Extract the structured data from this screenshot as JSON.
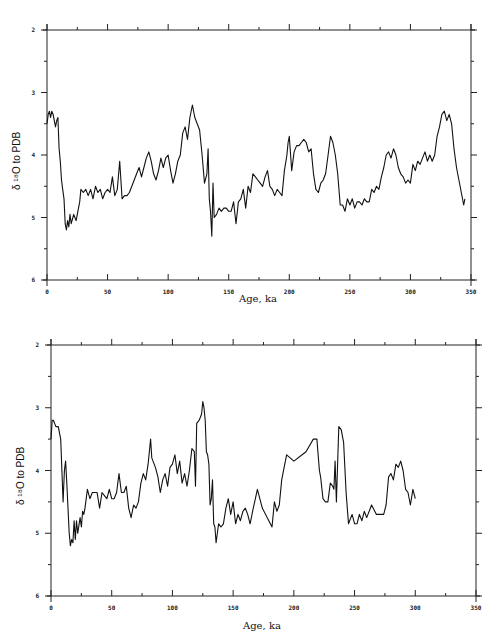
{
  "chart_data": [
    {
      "type": "line",
      "title": "",
      "xlabel": "Age, ka",
      "ylabel": "δ 18O to PDB",
      "xlim": [
        0,
        350
      ],
      "ylim": [
        6,
        2
      ],
      "y_inverted": true,
      "x_ticks": [
        "0",
        "50",
        "100",
        "150",
        "200",
        "250",
        "300",
        "350"
      ],
      "y_ticks": [
        "2",
        "3",
        "4",
        "5",
        "6"
      ],
      "grid": false,
      "legend": null,
      "series": [
        {
          "name": "record-1",
          "x": [
            0,
            1,
            2,
            3,
            4,
            5,
            6,
            7,
            8,
            9,
            10,
            11,
            12,
            13,
            14,
            15,
            16,
            17,
            18,
            19,
            20,
            22,
            24,
            26,
            27,
            28,
            30,
            32,
            34,
            36,
            38,
            40,
            42,
            44,
            46,
            48,
            50,
            52,
            54,
            56,
            58,
            60,
            62,
            64,
            66,
            68,
            70,
            72,
            74,
            76,
            78,
            80,
            82,
            84,
            86,
            88,
            90,
            92,
            94,
            96,
            98,
            100,
            102,
            104,
            106,
            108,
            110,
            112,
            114,
            116,
            118,
            120,
            122,
            124,
            126,
            128,
            130,
            132,
            133,
            134,
            135,
            136,
            137,
            138,
            140,
            142,
            144,
            146,
            148,
            150,
            152,
            154,
            156,
            158,
            160,
            162,
            164,
            166,
            168,
            170,
            172,
            174,
            176,
            178,
            180,
            182,
            184,
            186,
            188,
            190,
            192,
            194,
            196,
            198,
            199,
            200,
            202,
            204,
            206,
            208,
            210,
            212,
            214,
            216,
            218,
            220,
            222,
            224,
            226,
            228,
            230,
            232,
            234,
            236,
            238,
            240,
            242,
            244,
            246,
            248,
            250,
            252,
            254,
            256,
            258,
            260,
            262,
            264,
            266,
            268,
            270,
            272,
            274,
            276,
            278,
            280,
            282,
            284,
            286,
            288,
            290,
            292,
            294,
            296,
            298,
            300,
            302,
            304,
            306,
            308,
            310,
            312,
            314,
            316,
            318,
            320,
            322,
            324,
            326,
            328,
            330,
            332,
            334,
            336,
            338,
            340,
            342,
            344,
            345
          ],
          "y": [
            3.5,
            3.35,
            3.3,
            3.4,
            3.3,
            3.35,
            3.45,
            3.55,
            3.45,
            3.4,
            3.9,
            4.1,
            4.4,
            4.55,
            4.7,
            5.1,
            5.2,
            5.05,
            5.15,
            4.95,
            5.1,
            4.95,
            5.05,
            4.85,
            4.75,
            4.55,
            4.6,
            4.55,
            4.65,
            4.55,
            4.7,
            4.5,
            4.6,
            4.55,
            4.7,
            4.6,
            4.55,
            4.6,
            4.35,
            4.65,
            4.55,
            4.1,
            4.7,
            4.65,
            4.65,
            4.6,
            4.5,
            4.4,
            4.3,
            4.2,
            4.35,
            4.2,
            4.05,
            3.95,
            4.1,
            4.3,
            4.4,
            4.25,
            4.05,
            4.2,
            4.05,
            4.0,
            4.25,
            4.45,
            4.3,
            4.1,
            4.0,
            3.65,
            3.55,
            3.75,
            3.4,
            3.2,
            3.4,
            3.5,
            3.6,
            4.0,
            4.45,
            4.3,
            3.9,
            4.7,
            4.9,
            5.3,
            4.45,
            5.0,
            4.95,
            4.85,
            4.9,
            4.85,
            4.85,
            4.9,
            4.9,
            4.75,
            5.1,
            4.75,
            4.7,
            4.55,
            4.85,
            4.5,
            4.6,
            4.3,
            4.35,
            4.4,
            4.45,
            4.5,
            4.35,
            4.25,
            4.5,
            4.55,
            4.65,
            4.55,
            4.6,
            4.65,
            4.25,
            4.0,
            3.8,
            3.7,
            4.25,
            3.95,
            3.85,
            3.85,
            3.8,
            3.75,
            3.8,
            3.95,
            3.9,
            4.3,
            4.55,
            4.6,
            4.45,
            4.4,
            4.3,
            4.0,
            3.7,
            3.8,
            4.0,
            4.3,
            4.8,
            4.8,
            4.9,
            4.7,
            4.8,
            4.7,
            4.85,
            4.75,
            4.75,
            4.8,
            4.7,
            4.75,
            4.75,
            4.55,
            4.6,
            4.5,
            4.55,
            4.35,
            4.2,
            4.0,
            3.95,
            4.05,
            3.9,
            4.0,
            4.2,
            4.3,
            4.35,
            4.45,
            4.4,
            4.45,
            4.15,
            4.25,
            4.1,
            4.15,
            4.05,
            3.95,
            4.1,
            4.0,
            4.1,
            4.0,
            3.7,
            3.55,
            3.35,
            3.3,
            3.45,
            3.35,
            3.5,
            3.9,
            4.2,
            4.4,
            4.6,
            4.8,
            4.7
          ]
        }
      ]
    },
    {
      "type": "line",
      "title": "",
      "xlabel": "Age, ka",
      "ylabel": "δ 18O to PDB",
      "xlim": [
        0,
        350
      ],
      "ylim": [
        6,
        2
      ],
      "y_inverted": true,
      "x_ticks": [
        "0",
        "50",
        "100",
        "150",
        "200",
        "250",
        "300",
        "350"
      ],
      "y_ticks": [
        "2",
        "3",
        "4",
        "5",
        "6"
      ],
      "grid": false,
      "legend": null,
      "series": [
        {
          "name": "record-2",
          "x": [
            0,
            1,
            2,
            4,
            6,
            7,
            8,
            9,
            10,
            11,
            12,
            13,
            14,
            15,
            16,
            17,
            18,
            19,
            20,
            21,
            22,
            24,
            25,
            26,
            27,
            28,
            30,
            32,
            34,
            36,
            38,
            40,
            42,
            44,
            46,
            48,
            50,
            52,
            54,
            56,
            58,
            60,
            62,
            64,
            66,
            68,
            70,
            72,
            74,
            76,
            78,
            80,
            82,
            83,
            84,
            86,
            88,
            90,
            92,
            94,
            96,
            98,
            100,
            102,
            104,
            106,
            108,
            110,
            112,
            114,
            116,
            118,
            119,
            120,
            122,
            123,
            124,
            125,
            126,
            127,
            128,
            129,
            130,
            131,
            132,
            133,
            134,
            135,
            136,
            138,
            140,
            142,
            144,
            146,
            148,
            150,
            152,
            154,
            156,
            158,
            160,
            162,
            164,
            166,
            170,
            174,
            182,
            184,
            186,
            188,
            190,
            194,
            200,
            210,
            216,
            219,
            221,
            222,
            224,
            226,
            228,
            230,
            232,
            233,
            234,
            235,
            237,
            239,
            241,
            243,
            245,
            248,
            250,
            252,
            254,
            256,
            258,
            260,
            264,
            268,
            272,
            274,
            276,
            278,
            280,
            282,
            284,
            286,
            288,
            290,
            292,
            294,
            296,
            298,
            300
          ],
          "y": [
            3.5,
            3.2,
            3.2,
            3.3,
            3.3,
            3.4,
            3.5,
            4.0,
            4.5,
            4.0,
            3.85,
            4.2,
            4.6,
            5.0,
            5.2,
            5.1,
            5.15,
            4.8,
            5.1,
            4.8,
            5.0,
            4.75,
            4.9,
            4.65,
            4.7,
            4.6,
            4.3,
            4.45,
            4.35,
            4.35,
            4.35,
            4.6,
            4.35,
            4.4,
            4.45,
            4.3,
            4.45,
            4.45,
            4.35,
            4.05,
            4.35,
            4.35,
            4.25,
            4.6,
            4.75,
            4.55,
            4.6,
            4.5,
            4.2,
            4.05,
            4.15,
            3.9,
            3.5,
            3.8,
            3.85,
            3.95,
            4.1,
            4.35,
            4.15,
            4.05,
            4.25,
            3.95,
            3.9,
            3.75,
            4.05,
            3.85,
            4.2,
            4.05,
            4.25,
            4.0,
            3.65,
            3.7,
            4.25,
            3.25,
            3.2,
            3.15,
            3.1,
            2.9,
            3.0,
            3.2,
            3.7,
            3.75,
            3.9,
            4.55,
            4.45,
            4.15,
            4.85,
            4.9,
            5.15,
            4.85,
            4.9,
            4.85,
            4.6,
            4.45,
            4.7,
            4.5,
            4.85,
            4.7,
            4.8,
            4.65,
            4.6,
            4.7,
            4.85,
            4.65,
            4.3,
            4.6,
            4.9,
            4.5,
            4.65,
            4.55,
            4.15,
            3.75,
            3.85,
            3.7,
            3.5,
            3.5,
            4.0,
            4.1,
            4.45,
            4.5,
            4.5,
            4.2,
            4.25,
            4.3,
            3.85,
            4.5,
            3.3,
            3.35,
            3.55,
            4.35,
            4.85,
            4.7,
            4.85,
            4.85,
            4.7,
            4.8,
            4.65,
            4.75,
            4.55,
            4.7,
            4.7,
            4.7,
            4.55,
            4.1,
            4.05,
            4.15,
            3.9,
            3.95,
            3.85,
            4.0,
            4.3,
            4.35,
            4.55,
            4.3,
            4.45,
            4.2
          ]
        }
      ]
    }
  ],
  "panels": {
    "top": {
      "ylabel": "δ ¹⁸O to PDB",
      "xlabel": "Age, ka"
    },
    "bottom": {
      "ylabel": "δ ¹⁸O to PDB",
      "xlabel": "Age, ka"
    }
  },
  "colors": {
    "line": "#111111",
    "axis": "#222222",
    "background": "#ffffff"
  }
}
